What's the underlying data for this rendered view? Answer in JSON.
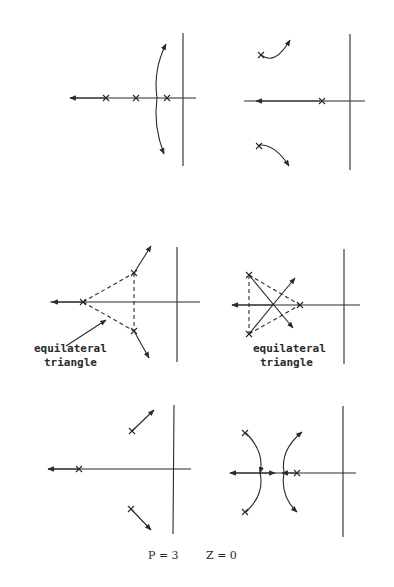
{
  "figure": {
    "caption_p": "P = 3",
    "caption_z": "Z = 0",
    "ink_color": "#2a2a2a",
    "panels": [
      {
        "id": "panel-1",
        "description": "three real poles, two branches break away and curve to complex asymptotes, one to -infinity"
      },
      {
        "id": "panel-2",
        "description": "one real pole and two complex poles; complex branches curve toward upper/lower right"
      },
      {
        "id": "panel-3",
        "description": "three poles forming an equilateral triangle (one real left), branches radial outward",
        "label_line1": "equilateral",
        "label_line2": "triangle"
      },
      {
        "id": "panel-4",
        "description": "three poles forming equilateral triangle (real one right), branches crossing at centroid",
        "label_line1": "equilateral",
        "label_line2": "triangle"
      },
      {
        "id": "panel-5",
        "description": "one real pole with branch to -infinity, two complex poles with straight branches outward"
      },
      {
        "id": "panel-6",
        "description": "real pole and two complex poles; branches meet on real axis and split"
      }
    ]
  }
}
